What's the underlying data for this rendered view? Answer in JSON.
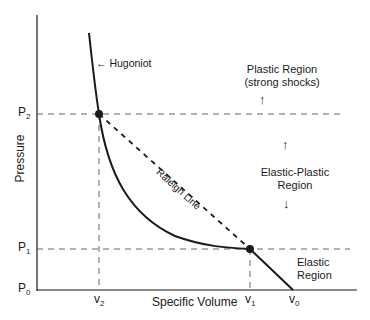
{
  "axes": {
    "xlabel": "Specific Volume",
    "ylabel": "Pressure",
    "y_ticks": [
      {
        "base": "P",
        "sub": "2"
      },
      {
        "base": "P",
        "sub": "1"
      },
      {
        "base": "P",
        "sub": "0"
      }
    ],
    "x_ticks": [
      {
        "base": "v",
        "sub": "2"
      },
      {
        "base": "v",
        "sub": "1"
      },
      {
        "base": "v",
        "sub": "0"
      }
    ]
  },
  "curves": {
    "hugoniot_label": "← Hugoniot",
    "rayleigh_label": "Raleigh Line"
  },
  "regions": {
    "plastic": {
      "line1": "Plastic Region",
      "line2": "(strong shocks)",
      "arrow": "↑"
    },
    "elastic_plastic": {
      "line1": "Elastic-Plastic",
      "line2": "Region",
      "arrow_up": "↑",
      "arrow_down": "↓"
    },
    "elastic": {
      "line1": "Elastic",
      "line2": "Region"
    }
  },
  "colors": {
    "line": "#1a1a1a",
    "dash": "#555555"
  }
}
